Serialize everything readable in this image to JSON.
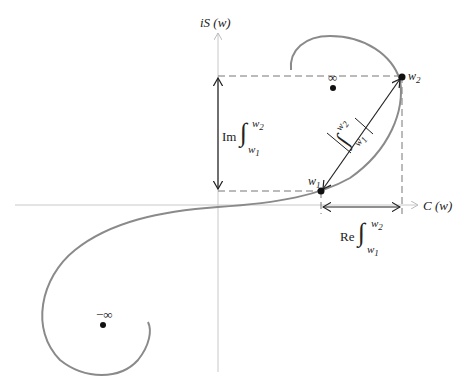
{
  "diagram": {
    "type": "cornu-spiral",
    "axes": {
      "x_label": "C (w)",
      "y_label": "iS (w)"
    },
    "points": {
      "w1": {
        "label": "w",
        "sub": "1"
      },
      "w2": {
        "label": "w",
        "sub": "2"
      },
      "pos_inf": {
        "label": "∞"
      },
      "neg_inf": {
        "label": "−∞"
      }
    },
    "annotations": {
      "im_integral": {
        "prefix": "Im",
        "integral": "∫",
        "upper": "w",
        "upper_sub": "2",
        "lower": "w",
        "lower_sub": "1"
      },
      "re_integral": {
        "prefix": "Re",
        "integral": "∫",
        "upper": "w",
        "upper_sub": "2",
        "lower": "w",
        "lower_sub": "1"
      },
      "abs_integral": {
        "integral": "∫",
        "upper": "w",
        "upper_sub": "2",
        "lower": "w",
        "lower_sub": "1"
      }
    },
    "colors": {
      "curve": "#8a8a8a",
      "axes": "#c8c8c8",
      "dashed": "#777777",
      "arrows": "#222222",
      "dots": "#111111"
    }
  }
}
